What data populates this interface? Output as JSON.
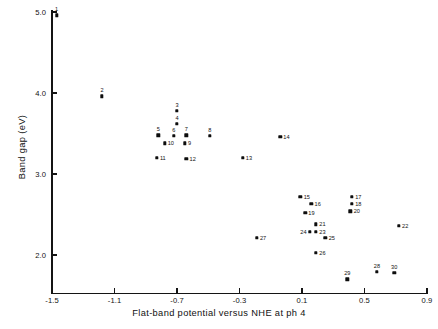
{
  "chart_data": {
    "type": "scatter",
    "title": "",
    "xlabel": "Flat-band potential versus NHE at ph 4",
    "ylabel": "Band gap (eV)",
    "xlim": [
      -1.5,
      0.9
    ],
    "ylim": [
      1.55,
      5.1
    ],
    "grid": false,
    "legend": "none",
    "xticks": [
      "-1.5",
      "-1.1",
      "-0.7",
      "-0.3",
      "0.1",
      "0.5",
      "0.9"
    ],
    "xtick_values": [
      -1.5,
      -1.1,
      -0.7,
      -0.3,
      0.1,
      0.5,
      0.9
    ],
    "yticks": [
      "2.0",
      "3.0",
      "4.0",
      "5.0"
    ],
    "ytick_values": [
      2.0,
      3.0,
      4.0,
      5.0
    ],
    "point_label_field": "label",
    "points": [
      {
        "label": "1",
        "x": -1.47,
        "y": 4.96,
        "lx": "above"
      },
      {
        "label": "2",
        "x": -1.18,
        "y": 3.96,
        "lx": "above"
      },
      {
        "label": "3",
        "x": -0.7,
        "y": 3.78,
        "lx": "above"
      },
      {
        "label": "4",
        "x": -0.7,
        "y": 3.62,
        "lx": "above"
      },
      {
        "label": "5",
        "x": -0.82,
        "y": 3.48,
        "lx": "above"
      },
      {
        "label": "6",
        "x": -0.72,
        "y": 3.47,
        "lx": "above"
      },
      {
        "label": "7",
        "x": -0.64,
        "y": 3.48,
        "lx": "above"
      },
      {
        "label": "8",
        "x": -0.49,
        "y": 3.47,
        "lx": "above"
      },
      {
        "label": "9",
        "x": -0.65,
        "y": 3.38,
        "lx": "right"
      },
      {
        "label": "10",
        "x": -0.78,
        "y": 3.38,
        "lx": "right"
      },
      {
        "label": "11",
        "x": -0.83,
        "y": 3.2,
        "lx": "right"
      },
      {
        "label": "12",
        "x": -0.64,
        "y": 3.19,
        "lx": "right"
      },
      {
        "label": "13",
        "x": -0.28,
        "y": 3.2,
        "lx": "right"
      },
      {
        "label": "14",
        "x": -0.04,
        "y": 3.46,
        "lx": "right"
      },
      {
        "label": "15",
        "x": 0.09,
        "y": 2.72,
        "lx": "right"
      },
      {
        "label": "16",
        "x": 0.16,
        "y": 2.63,
        "lx": "right"
      },
      {
        "label": "17",
        "x": 0.42,
        "y": 2.72,
        "lx": "right"
      },
      {
        "label": "18",
        "x": 0.42,
        "y": 2.63,
        "lx": "right"
      },
      {
        "label": "19",
        "x": 0.12,
        "y": 2.52,
        "lx": "right"
      },
      {
        "label": "20",
        "x": 0.41,
        "y": 2.54,
        "lx": "right"
      },
      {
        "label": "21",
        "x": 0.19,
        "y": 2.38,
        "lx": "right"
      },
      {
        "label": "22",
        "x": 0.72,
        "y": 2.36,
        "lx": "right"
      },
      {
        "label": "23",
        "x": 0.19,
        "y": 2.29,
        "lx": "right"
      },
      {
        "label": "24",
        "x": 0.15,
        "y": 2.29,
        "lx": "left"
      },
      {
        "label": "25",
        "x": 0.25,
        "y": 2.21,
        "lx": "right"
      },
      {
        "label": "26",
        "x": 0.19,
        "y": 2.03,
        "lx": "right"
      },
      {
        "label": "27",
        "x": -0.19,
        "y": 2.21,
        "lx": "right"
      },
      {
        "label": "28",
        "x": 0.58,
        "y": 1.79,
        "lx": "above"
      },
      {
        "label": "29",
        "x": 0.39,
        "y": 1.7,
        "lx": "above"
      },
      {
        "label": "30",
        "x": 0.69,
        "y": 1.78,
        "lx": "above"
      }
    ]
  },
  "axes": {
    "xlabel": "Flat-band potential versus NHE at ph 4",
    "ylabel": "Band gap (eV)"
  }
}
